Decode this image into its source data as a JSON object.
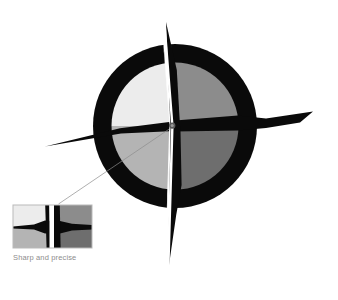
{
  "figure": {
    "title": "Sharp and precise",
    "caption": "Sharp and precise",
    "type": "compass-dial-illustration",
    "background_color": "#ffffff",
    "dial": {
      "center_x": 175,
      "center_y": 126,
      "outer_radius": 82,
      "ring_color": "#0a0a0a",
      "ring_thickness": 19,
      "inner_radius": 63,
      "quadrants": [
        {
          "name": "quadrant-top-left",
          "label": "NW",
          "color": "#ececec"
        },
        {
          "name": "quadrant-top-right",
          "label": "NE",
          "color": "#8c8c8c"
        },
        {
          "name": "quadrant-bottom-left",
          "label": "SW",
          "color": "#b4b4b4"
        },
        {
          "name": "quadrant-bottom-right",
          "label": "SE",
          "color": "#6e6e6e"
        }
      ]
    },
    "needles": [
      {
        "name": "needle-north",
        "direction": "north",
        "tip_y": 22,
        "color_left": "#ffffff",
        "color_right": "#0a0a0a"
      },
      {
        "name": "needle-south",
        "direction": "south",
        "tip_y": 272,
        "color_left": "#ffffff",
        "color_right": "#0a0a0a"
      },
      {
        "name": "needle-east",
        "direction": "east",
        "tip_x": 313,
        "color": "#0a0a0a"
      },
      {
        "name": "needle-west",
        "direction": "west",
        "tip_x": 45,
        "color": "#0a0a0a"
      }
    ],
    "pivot": {
      "name": "pivot-hub",
      "radius": 3.2,
      "color": "#5a5a5a"
    },
    "inset": {
      "name": "magnified-inset",
      "x": 13,
      "y": 205,
      "width": 79,
      "height": 43,
      "border_color": "#b9b9b9",
      "magnifies": "dial-center",
      "leader_line_color": "#8c8c8c",
      "panes": [
        {
          "name": "inset-pane-left",
          "quadrant_upper": "#ececec",
          "quadrant_lower": "#b4b4b4"
        },
        {
          "name": "inset-pane-right",
          "quadrant_upper": "#8c8c8c",
          "quadrant_lower": "#6e6e6e"
        }
      ]
    },
    "colors": {
      "black": "#0a0a0a",
      "white": "#ffffff",
      "light_gray": "#ececec",
      "mid_light_gray": "#b4b4b4",
      "mid_gray": "#8c8c8c",
      "dark_gray": "#6e6e6e",
      "caption_gray": "#8d8d8d",
      "inset_border": "#b9b9b9",
      "leader_line": "#8c8c8c"
    }
  }
}
